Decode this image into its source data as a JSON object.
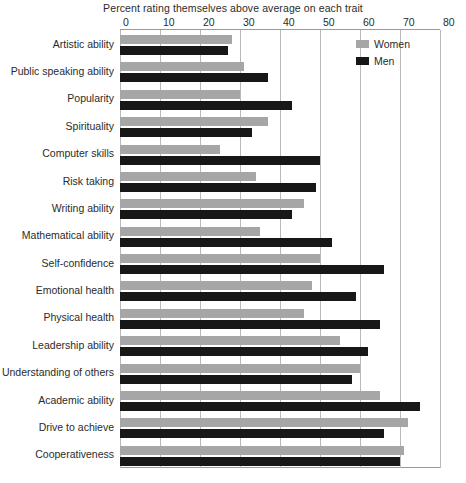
{
  "chart_data": {
    "type": "bar",
    "orientation": "horizontal",
    "title": "Percent rating themselves above average on each trait",
    "xlabel": "",
    "ylabel": "",
    "xlim": [
      0,
      80
    ],
    "xticks": [
      0,
      10,
      20,
      30,
      40,
      50,
      60,
      70,
      80
    ],
    "grid": true,
    "legend_position": "top-right",
    "colors": {
      "women": "#a6a6a6",
      "men": "#171717"
    },
    "categories": [
      "Artistic ability",
      "Public speaking ability",
      "Popularity",
      "Spirituality",
      "Computer skills",
      "Risk taking",
      "Writing ability",
      "Mathematical ability",
      "Self-confidence",
      "Emotional health",
      "Physical health",
      "Leadership ability",
      "Understanding of others",
      "Academic ability",
      "Drive to achieve",
      "Cooperativeness"
    ],
    "series": [
      {
        "name": "Women",
        "values": [
          28,
          31,
          30,
          37,
          25,
          34,
          46,
          35,
          50,
          48,
          46,
          55,
          60,
          65,
          72,
          71
        ]
      },
      {
        "name": "Men",
        "values": [
          27,
          37,
          43,
          33,
          50,
          49,
          43,
          53,
          66,
          59,
          65,
          62,
          58,
          75,
          66,
          70
        ]
      }
    ]
  },
  "legend": {
    "entries": [
      {
        "label": "Women",
        "swatch": "women"
      },
      {
        "label": "Men",
        "swatch": "men"
      }
    ]
  }
}
